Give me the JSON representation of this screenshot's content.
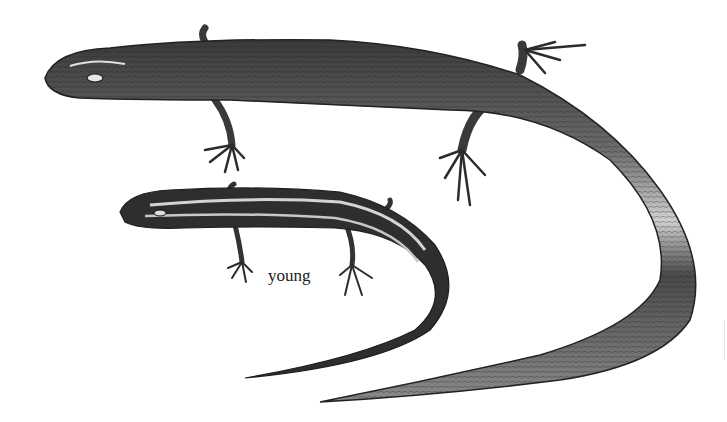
{
  "illustration": {
    "subject": "skinks",
    "figures": [
      {
        "id": "adult",
        "description": "adult lizard, large, striped body, long curving tail"
      },
      {
        "id": "young",
        "description": "juvenile lizard, smaller, bold light stripes on dark body"
      }
    ],
    "labels": {
      "young": "young"
    },
    "colors": {
      "background": "#ffffff",
      "body_dark": "#2a2a2a",
      "body_mid": "#6e6e6e",
      "stripe_light": "#d8d8d8",
      "label": "#1c1c1c"
    }
  }
}
